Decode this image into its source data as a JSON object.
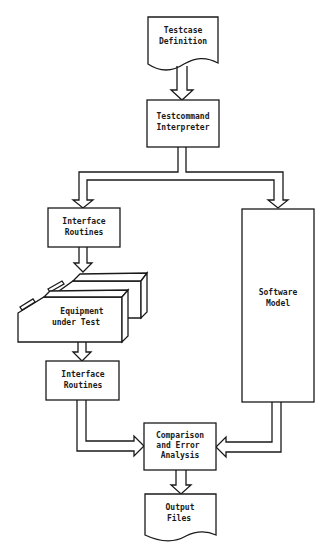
{
  "diagram": {
    "type": "flowchart",
    "nodes": {
      "testcase_definition": {
        "shape": "document",
        "line1": "Testcase",
        "line2": "Definition"
      },
      "testcommand_interpreter": {
        "shape": "process",
        "line1": "Testcommand",
        "line2": "Interpreter"
      },
      "interface_routines_top": {
        "shape": "process",
        "line1": "Interface",
        "line2": "Routines"
      },
      "equipment_under_test": {
        "shape": "3d-equipment",
        "line1": "Equipment",
        "line2": "under Test"
      },
      "interface_routines_bottom": {
        "shape": "process",
        "line1": "Interface",
        "line2": "Routines"
      },
      "software_model": {
        "shape": "process",
        "line1": "Software",
        "line2": "Model"
      },
      "comparison_error_analysis": {
        "shape": "process",
        "line1": "Comparison",
        "line2": "and Error",
        "line3": "Analysis"
      },
      "output_files": {
        "shape": "document",
        "line1": "Output",
        "line2": "Files"
      }
    },
    "edges": [
      {
        "from": "Testcase Definition",
        "to": "Testcommand Interpreter"
      },
      {
        "from": "Testcommand Interpreter",
        "to": "Interface Routines (top)"
      },
      {
        "from": "Testcommand Interpreter",
        "to": "Software Model"
      },
      {
        "from": "Interface Routines (top)",
        "to": "Equipment under Test"
      },
      {
        "from": "Equipment under Test",
        "to": "Interface Routines (bottom)"
      },
      {
        "from": "Interface Routines (bottom)",
        "to": "Comparison and Error Analysis"
      },
      {
        "from": "Software Model",
        "to": "Comparison and Error Analysis"
      },
      {
        "from": "Comparison and Error Analysis",
        "to": "Output Files"
      }
    ],
    "colors": {
      "ink": "#1a1a1a",
      "background": "#ffffff"
    }
  }
}
